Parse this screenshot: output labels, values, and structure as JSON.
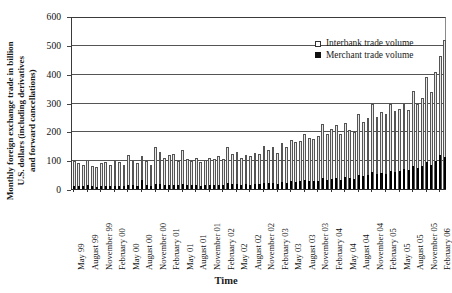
{
  "chart_data": {
    "type": "bar",
    "title": "",
    "xlabel": "Time",
    "ylabel": "Monthly foreign exchange trade in billion U.S. dollars (including derivatives and forward cancellations)",
    "ylabel_lines": [
      "Monthly foreign exchange trade in billion",
      "U.S. dollars (including derivatives",
      "and forward cancellations)"
    ],
    "ylim": [
      0,
      600
    ],
    "yticks": [
      0,
      100,
      200,
      300,
      400,
      500,
      600
    ],
    "grid": true,
    "grid_axis": "y",
    "legend_position": "top-right",
    "legend": [
      "Interbank trade volume",
      "Merchant trade volume"
    ],
    "colors": {
      "interbank": "#e8e8e8",
      "merchant": "#111111",
      "axis": "#333333",
      "grid": "#555555"
    },
    "categories": [
      "May 99",
      "June 99",
      "July 99",
      "August 99",
      "September 99",
      "October 99",
      "November 99",
      "December 99",
      "January 00",
      "February 00",
      "March 00",
      "April 00",
      "May 00",
      "June 00",
      "July 00",
      "August 00",
      "September 00",
      "October 00",
      "November 00",
      "December 00",
      "January 01",
      "February 01",
      "March 01",
      "April 01",
      "May 01",
      "June 01",
      "July 01",
      "August 01",
      "September 01",
      "October 01",
      "November 01",
      "December 01",
      "January 02",
      "February 02",
      "March 02",
      "April 02",
      "May 02",
      "June 02",
      "July 02",
      "August 02",
      "September 02",
      "October 02",
      "November 02",
      "December 02",
      "January 03",
      "February 03",
      "March 03",
      "April 03",
      "May 03",
      "June 03",
      "July 03",
      "August 03",
      "September 03",
      "October 03",
      "November 03",
      "December 03",
      "January 04",
      "February 04",
      "March 04",
      "April 04",
      "May 04",
      "June 04",
      "July 04",
      "August 04",
      "September 04",
      "October 04",
      "November 04",
      "December 04",
      "January 05",
      "February 05",
      "March 05",
      "April 05",
      "May 05",
      "June 05",
      "July 05",
      "August 05",
      "September 05",
      "October 05",
      "November 05",
      "December 05",
      "January 06",
      "February 06",
      "March 06"
    ],
    "tick_labels": [
      "May 99",
      "August 99",
      "November 99",
      "February 00",
      "May 00",
      "August 00",
      "November 00",
      "February 01",
      "May 01",
      "August 01",
      "November 01",
      "February 02",
      "May 02",
      "August 02",
      "November 02",
      "February 03",
      "May 03",
      "August 03",
      "November 03",
      "February 04",
      "May 04",
      "August 04",
      "November 04",
      "February 05",
      "May 05",
      "August 05",
      "November 05",
      "February 06"
    ],
    "tick_indices": [
      0,
      3,
      6,
      9,
      12,
      15,
      18,
      21,
      24,
      27,
      30,
      33,
      36,
      39,
      42,
      45,
      48,
      51,
      54,
      57,
      60,
      63,
      66,
      69,
      72,
      75,
      78,
      81
    ],
    "series": [
      {
        "name": "Interbank trade volume",
        "values": [
          100,
          92,
          88,
          104,
          84,
          80,
          92,
          97,
          86,
          102,
          98,
          86,
          120,
          104,
          94,
          118,
          100,
          86,
          150,
          132,
          110,
          120,
          126,
          102,
          140,
          106,
          100,
          112,
          96,
          104,
          112,
          108,
          118,
          108,
          150,
          126,
          132,
          110,
          122,
          118,
          128,
          124,
          152,
          140,
          150,
          130,
          164,
          150,
          174,
          168,
          170,
          196,
          182,
          176,
          186,
          230,
          196,
          212,
          226,
          194,
          234,
          208,
          200,
          262,
          236,
          250,
          300,
          254,
          272,
          262,
          300,
          274,
          282,
          300,
          278,
          344,
          300,
          320,
          392,
          340,
          410,
          464,
          520
        ]
      },
      {
        "name": "Merchant trade volume",
        "values": [
          14,
          13,
          13,
          16,
          13,
          12,
          14,
          15,
          13,
          15,
          15,
          14,
          18,
          16,
          15,
          34,
          16,
          14,
          22,
          20,
          17,
          18,
          19,
          16,
          21,
          17,
          16,
          18,
          15,
          17,
          18,
          17,
          19,
          17,
          23,
          20,
          21,
          18,
          20,
          19,
          21,
          20,
          25,
          23,
          25,
          22,
          28,
          26,
          30,
          29,
          30,
          34,
          32,
          31,
          33,
          40,
          35,
          38,
          41,
          36,
          44,
          40,
          39,
          52,
          48,
          52,
          62,
          54,
          58,
          57,
          66,
          62,
          66,
          72,
          68,
          84,
          76,
          82,
          96,
          88,
          100,
          122,
          116
        ]
      }
    ]
  }
}
